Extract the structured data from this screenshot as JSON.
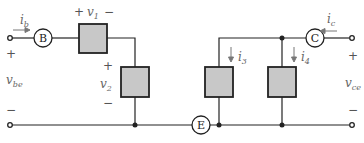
{
  "nodes": {
    "B": "B",
    "C": "C",
    "E": "E"
  },
  "labels": {
    "ib": "i",
    "ib_sub": "b",
    "ic": "i",
    "ic_sub": "c",
    "v1": "v",
    "v1_sub": "1",
    "v2": "v",
    "v2_sub": "2",
    "i3": "i",
    "i3_sub": "3",
    "i4": "i",
    "i4_sub": "4",
    "vbe": "v",
    "vbe_sub": "be",
    "vce": "v",
    "vce_sub": "ce"
  },
  "signs": {
    "plus": "+",
    "minus": "−"
  },
  "colors": {
    "box_fill": "#c8c8c8",
    "wire": "#222222",
    "arrow": "#777777"
  }
}
